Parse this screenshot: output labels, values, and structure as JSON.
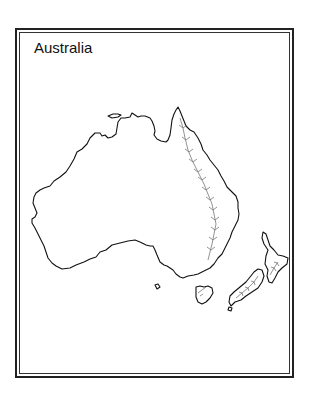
{
  "title": "Australia",
  "colors": {
    "outline": "#111111",
    "mountains": "#777777",
    "background": "#ffffff"
  },
  "features": [
    "australia-mainland",
    "tasmania",
    "new-zealand-north-island",
    "new-zealand-south-island",
    "great-dividing-range"
  ]
}
